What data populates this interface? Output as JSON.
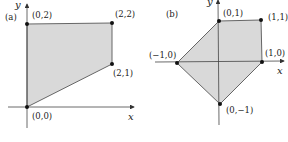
{
  "panels": [
    {
      "id": "a",
      "label": "(a)",
      "x_axis_label": "x",
      "y_axis_label": "y",
      "vertices": [
        {
          "label": "(0,0)",
          "x": 0,
          "y": 0
        },
        {
          "label": "(0,2)",
          "x": 0,
          "y": 2
        },
        {
          "label": "(2,2)",
          "x": 2,
          "y": 2
        },
        {
          "label": "(2,1)",
          "x": 2,
          "y": 1
        }
      ]
    },
    {
      "id": "b",
      "label": "(b)",
      "x_axis_label": "x",
      "y_axis_label": "y",
      "vertices": [
        {
          "label": "(0,1)",
          "x": 0,
          "y": 1
        },
        {
          "label": "(1,1)",
          "x": 1,
          "y": 1
        },
        {
          "label": "(1,0)",
          "x": 1,
          "y": 0
        },
        {
          "label": "(0,−1)",
          "x": 0,
          "y": -1
        },
        {
          "label": "(−1,0)",
          "x": -1,
          "y": 0
        }
      ]
    }
  ],
  "colors": {
    "fill": "#d9d9d9",
    "edge": "#666666",
    "axis": "#444444",
    "vertex": "#111111"
  }
}
